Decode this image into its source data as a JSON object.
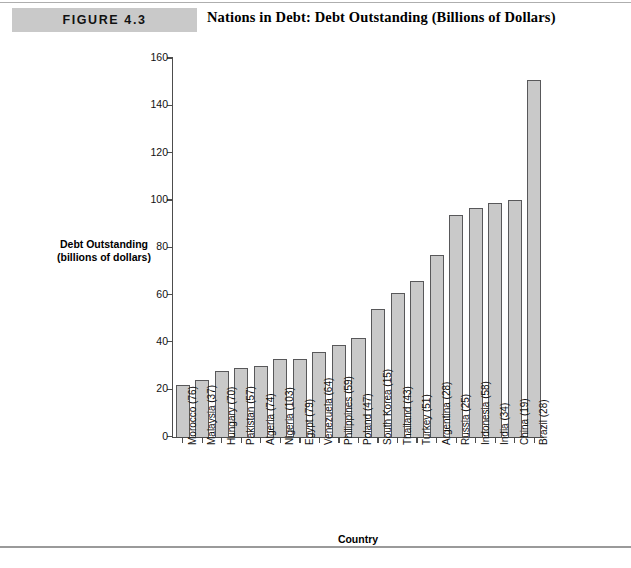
{
  "header": {
    "figure_tag": "FIGURE 4.3",
    "title": "Nations in Debt: Debt Outstanding (Billions of Dollars)"
  },
  "chart_data": {
    "type": "bar",
    "title": "Nations in Debt: Debt Outstanding (Billions of Dollars)",
    "xlabel": "Country",
    "ylabel": "Debt Outstanding (billions of dollars)",
    "ylabel_line1": "Debt Outstanding",
    "ylabel_line2": "(billions of dollars)",
    "ylim": [
      0,
      160
    ],
    "yticks": [
      0,
      20,
      40,
      60,
      80,
      100,
      120,
      140,
      160
    ],
    "ytick_labels": [
      "0",
      "20",
      "40",
      "60",
      "80",
      "100",
      "120",
      "140",
      "160"
    ],
    "grid": false,
    "legend": false,
    "bar_color": "#c9c9c9",
    "bar_edge_color": "#58585a",
    "categories": [
      "Morocco (76)",
      "Malaysia (37)",
      "Hungary (70)",
      "Pakistan (57)",
      "Algeria (74)",
      "Nigeria (103)",
      "Egypt (79)",
      "Venezuela (64)",
      "Philippines (59)",
      "Poland (47)",
      "South Korea (15)",
      "Thailand (43)",
      "Turkey (51)",
      "Argentina (28)",
      "Russia (25)",
      "Indonesia (58)",
      "India (34)",
      "China (19)",
      "Brazil (28)"
    ],
    "values": [
      22,
      24,
      28,
      29,
      30,
      33,
      33,
      36,
      39,
      42,
      54,
      61,
      66,
      77,
      94,
      97,
      99,
      100,
      151
    ]
  }
}
